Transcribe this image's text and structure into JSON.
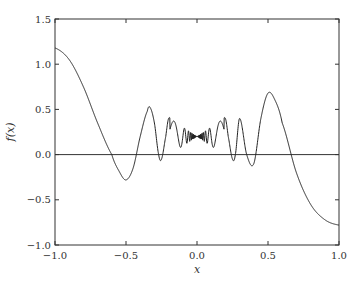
{
  "chart_data": {
    "type": "line",
    "title": "",
    "xlabel": "x",
    "ylabel": "f(x)",
    "xlim": [
      -1.0,
      1.0
    ],
    "ylim": [
      -1.0,
      1.5
    ],
    "xticks": [
      "-1.0",
      "-0.5",
      "0.0",
      "0.5",
      "1.0"
    ],
    "yticks": [
      "-1.0",
      "-0.5",
      "0.0",
      "0.5",
      "1.0",
      "1.5"
    ],
    "grid": false,
    "legend": null,
    "reference_line": {
      "y": 0.0
    },
    "series": [
      {
        "name": "f(x)",
        "note": "Approximate points read off the plot; center region oscillates rapidly around ~0.2 with shrinking amplitude near x=0",
        "x": [
          -1.0,
          -0.9,
          -0.8,
          -0.7,
          -0.6,
          -0.55,
          -0.5,
          -0.45,
          -0.4,
          -0.35,
          -0.33,
          -0.3,
          -0.27,
          -0.25,
          -0.22,
          -0.2,
          -0.18,
          -0.15,
          -0.1,
          -0.05,
          0.0,
          0.05,
          0.1,
          0.15,
          0.18,
          0.2,
          0.22,
          0.25,
          0.27,
          0.3,
          0.35,
          0.4,
          0.45,
          0.5,
          0.55,
          0.6,
          0.7,
          0.8,
          0.9,
          1.0
        ],
        "y": [
          1.18,
          1.05,
          0.75,
          0.35,
          0.0,
          -0.18,
          -0.28,
          -0.15,
          0.2,
          0.48,
          0.52,
          0.35,
          0.0,
          -0.05,
          0.2,
          0.4,
          0.35,
          0.1,
          0.15,
          0.2,
          0.22,
          0.24,
          0.3,
          0.1,
          0.35,
          0.4,
          0.2,
          -0.05,
          0.0,
          0.4,
          0.0,
          -0.1,
          0.4,
          0.68,
          0.6,
          0.35,
          -0.2,
          -0.55,
          -0.72,
          -0.78
        ]
      }
    ]
  },
  "axes": {
    "xlabel": "x",
    "ylabel": "f(x)"
  }
}
